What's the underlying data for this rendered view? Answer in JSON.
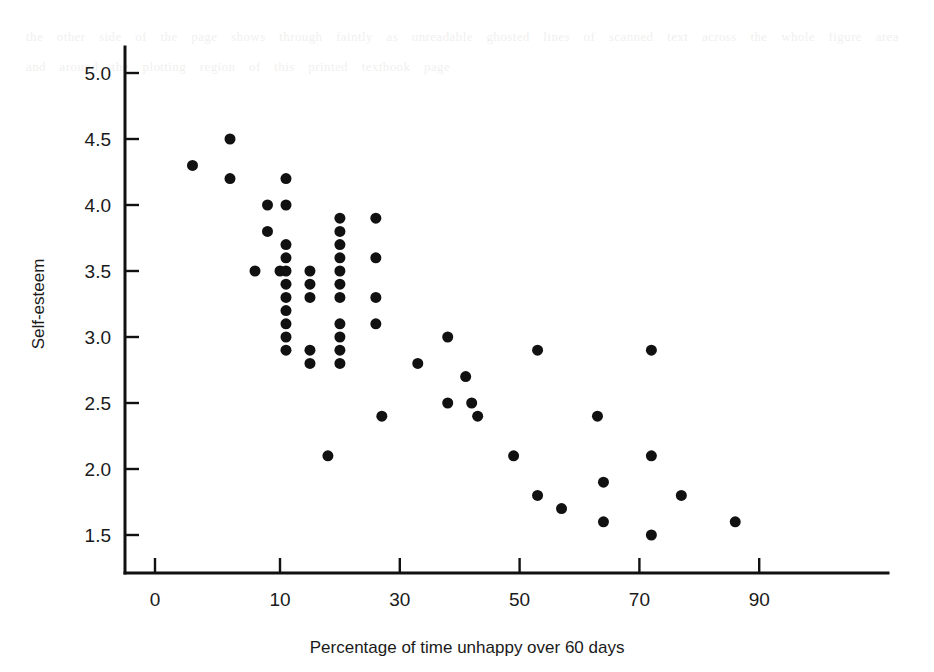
{
  "figure": {
    "background_color": "#ffffff",
    "marker_color": "#111111",
    "axis_color": "#111111",
    "bleed_text": "the other side of the page shows through faintly as unreadable ghosted lines of scanned text across the whole figure area and around the plotting region of this printed textbook page"
  },
  "chart_data": {
    "type": "scatter",
    "title": "",
    "xlabel": "Percentage of time unhappy over 60 days",
    "ylabel": "Self-esteem",
    "xticks": [
      0,
      10,
      30,
      50,
      70,
      90
    ],
    "xticklabels": [
      "0",
      "10",
      "30",
      "50",
      "70",
      "90"
    ],
    "yticks": [
      1.5,
      2.0,
      2.5,
      3.0,
      3.5,
      4.0,
      4.5,
      5.0
    ],
    "yticklabels": [
      "1.5",
      "2.0",
      "2.5",
      "3.0",
      "3.5",
      "4.0",
      "4.5",
      "5.0"
    ],
    "xlim": [
      -2,
      100
    ],
    "ylim": [
      1.2,
      5.2
    ],
    "grid": false,
    "legend": false,
    "marker": "filled-circle",
    "marker_size": 11,
    "points": [
      {
        "x": 3,
        "y": 4.3
      },
      {
        "x": 6,
        "y": 4.5
      },
      {
        "x": 6,
        "y": 4.2
      },
      {
        "x": 9,
        "y": 4.0
      },
      {
        "x": 9,
        "y": 3.8
      },
      {
        "x": 8,
        "y": 3.5
      },
      {
        "x": 10,
        "y": 3.5
      },
      {
        "x": 11,
        "y": 4.2
      },
      {
        "x": 11,
        "y": 4.0
      },
      {
        "x": 11,
        "y": 3.7
      },
      {
        "x": 11,
        "y": 3.6
      },
      {
        "x": 11,
        "y": 3.5
      },
      {
        "x": 11,
        "y": 3.4
      },
      {
        "x": 11,
        "y": 3.3
      },
      {
        "x": 11,
        "y": 3.2
      },
      {
        "x": 11,
        "y": 3.1
      },
      {
        "x": 11,
        "y": 3.0
      },
      {
        "x": 11,
        "y": 2.9
      },
      {
        "x": 15,
        "y": 3.5
      },
      {
        "x": 15,
        "y": 3.4
      },
      {
        "x": 15,
        "y": 3.3
      },
      {
        "x": 15,
        "y": 2.9
      },
      {
        "x": 15,
        "y": 2.8
      },
      {
        "x": 18,
        "y": 2.1
      },
      {
        "x": 20,
        "y": 3.9
      },
      {
        "x": 20,
        "y": 3.8
      },
      {
        "x": 20,
        "y": 3.7
      },
      {
        "x": 20,
        "y": 3.6
      },
      {
        "x": 20,
        "y": 3.5
      },
      {
        "x": 20,
        "y": 3.4
      },
      {
        "x": 20,
        "y": 3.3
      },
      {
        "x": 20,
        "y": 3.1
      },
      {
        "x": 20,
        "y": 3.0
      },
      {
        "x": 20,
        "y": 2.9
      },
      {
        "x": 20,
        "y": 2.8
      },
      {
        "x": 26,
        "y": 3.9
      },
      {
        "x": 26,
        "y": 3.6
      },
      {
        "x": 26,
        "y": 3.3
      },
      {
        "x": 26,
        "y": 3.1
      },
      {
        "x": 27,
        "y": 2.4
      },
      {
        "x": 33,
        "y": 2.8
      },
      {
        "x": 38,
        "y": 3.0
      },
      {
        "x": 38,
        "y": 2.5
      },
      {
        "x": 41,
        "y": 2.7
      },
      {
        "x": 42,
        "y": 2.5
      },
      {
        "x": 43,
        "y": 2.4
      },
      {
        "x": 49,
        "y": 2.1
      },
      {
        "x": 53,
        "y": 2.9
      },
      {
        "x": 53,
        "y": 1.8
      },
      {
        "x": 57,
        "y": 1.7
      },
      {
        "x": 63,
        "y": 2.4
      },
      {
        "x": 64,
        "y": 1.9
      },
      {
        "x": 64,
        "y": 1.6
      },
      {
        "x": 72,
        "y": 2.9
      },
      {
        "x": 72,
        "y": 2.1
      },
      {
        "x": 72,
        "y": 1.5
      },
      {
        "x": 77,
        "y": 1.8
      },
      {
        "x": 86,
        "y": 1.6
      }
    ]
  }
}
